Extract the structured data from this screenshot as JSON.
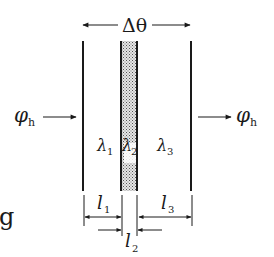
{
  "diagram": {
    "title_symbol": "Δθ",
    "flux_in": {
      "symbol": "φ",
      "subscript": "h"
    },
    "flux_out": {
      "symbol": "φ",
      "subscript": "h"
    },
    "layers": [
      {
        "conductivity_symbol": "λ",
        "conductivity_sub": "1",
        "thickness_symbol": "l",
        "thickness_sub": "1"
      },
      {
        "conductivity_symbol": "λ",
        "conductivity_sub": "2",
        "thickness_symbol": "l",
        "thickness_sub": "2"
      },
      {
        "conductivity_symbol": "λ",
        "conductivity_sub": "3",
        "thickness_symbol": "l",
        "thickness_sub": "3"
      }
    ],
    "edge_fragment": "g",
    "colors": {
      "line": "#1a1a1a",
      "shading": "#9a9a9a"
    }
  }
}
